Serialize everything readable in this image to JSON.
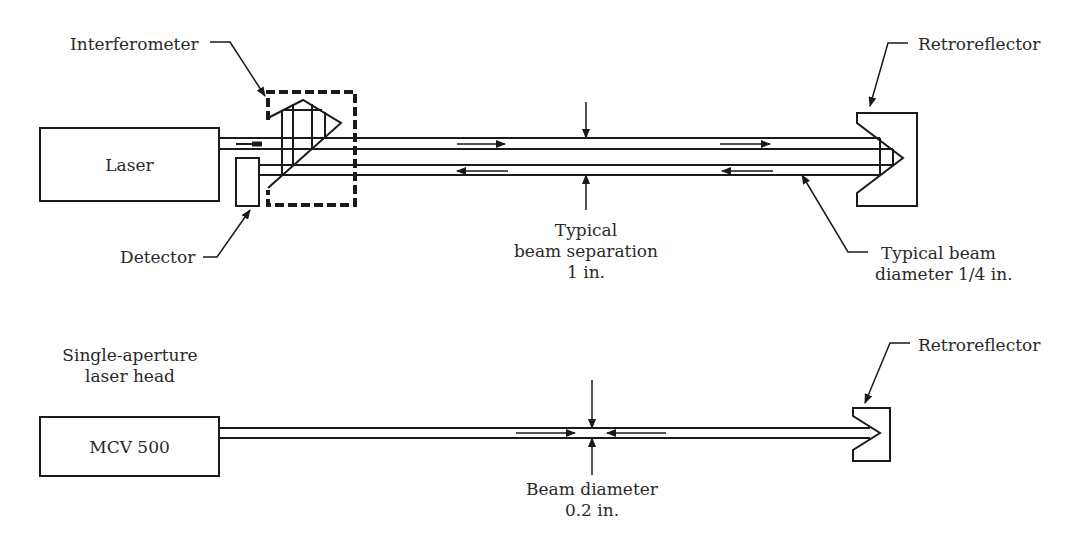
{
  "top_setup": {
    "laser_label": "Laser",
    "interferometer_label": "Interferometer",
    "detector_label": "Detector",
    "retroreflector_label": "Retroreflector",
    "beam_separation": {
      "line1": "Typical",
      "line2": "beam separation",
      "line3": "1 in."
    },
    "beam_diameter": {
      "line1": "Typical beam",
      "line2": "diameter 1/4 in."
    }
  },
  "bottom_setup": {
    "head_caption": {
      "line1": "Single-aperture",
      "line2": "laser head"
    },
    "laser_label": "MCV 500",
    "retroreflector_label": "Retroreflector",
    "beam_diameter": {
      "line1": "Beam diameter",
      "line2": "0.2 in."
    }
  },
  "colors": {
    "line": "#1a1a1a",
    "text": "#2a2a2a",
    "background": "#ffffff"
  }
}
